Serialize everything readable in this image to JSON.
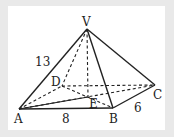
{
  "diagram": {
    "points": {
      "V": {
        "x": 87,
        "y": 29
      },
      "A": {
        "x": 19,
        "y": 109
      },
      "B": {
        "x": 113,
        "y": 108
      },
      "C": {
        "x": 155,
        "y": 85
      },
      "D": {
        "x": 62,
        "y": 86
      },
      "E": {
        "x": 88,
        "y": 97
      }
    },
    "labels": {
      "V": "V",
      "A": "A",
      "B": "B",
      "C": "C",
      "D": "D",
      "E": "E"
    },
    "measures": {
      "VA": "13",
      "AB": "8",
      "BC": "6"
    },
    "solid_edges": [
      [
        "V",
        "A"
      ],
      [
        "V",
        "B"
      ],
      [
        "V",
        "C"
      ],
      [
        "A",
        "B"
      ],
      [
        "B",
        "C"
      ],
      [
        "A",
        "E"
      ]
    ],
    "dashed_edges": [
      [
        "V",
        "D"
      ],
      [
        "V",
        "E"
      ],
      [
        "D",
        "C"
      ],
      [
        "A",
        "D"
      ],
      [
        "A",
        "C"
      ],
      [
        "D",
        "B"
      ]
    ],
    "line_color": "#222222",
    "background": "#e9e9e9",
    "panel_color": "#ffffff"
  }
}
